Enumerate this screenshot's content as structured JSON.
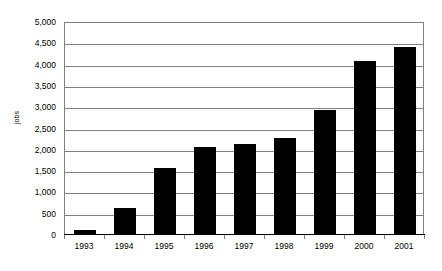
{
  "chart_data": {
    "type": "bar",
    "title": "",
    "subtitle": "",
    "xlabel": "",
    "ylabel": "jobs",
    "categories": [
      "1993",
      "1994",
      "1995",
      "1996",
      "1997",
      "1998",
      "1999",
      "2000",
      "2001"
    ],
    "values": [
      100,
      600,
      1550,
      2050,
      2120,
      2250,
      2900,
      4060,
      4380
    ],
    "series": [
      {
        "name": "jobs",
        "values": [
          100,
          600,
          1550,
          2050,
          2120,
          2250,
          2900,
          4060,
          4380
        ]
      }
    ],
    "ylim": [
      0,
      5000
    ],
    "ytick_step": 500,
    "ytick_labels": [
      "0",
      "500",
      "1,000",
      "1,500",
      "2,000",
      "2,500",
      "3,000",
      "3,500",
      "4,000",
      "4,500",
      "5,000"
    ],
    "ytick_values": [
      0,
      500,
      1000,
      1500,
      2000,
      2500,
      3000,
      3500,
      4000,
      4500,
      5000
    ],
    "grid": true,
    "grid_axis": "y",
    "legend": false,
    "legend_position": "none",
    "bar_color": "#000000",
    "grid_color": "#808080",
    "axis_color": "#000000",
    "background_color": "#ffffff"
  }
}
